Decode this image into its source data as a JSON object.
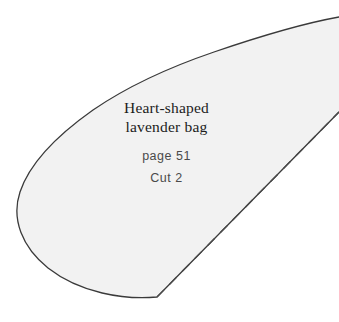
{
  "pattern": {
    "title_line_1": "Heart-shaped",
    "title_line_2": "lavender bag",
    "page_reference": "page 51",
    "cut_instruction": "Cut 2",
    "colors": {
      "background": "#ffffff",
      "shape_fill": "#f2f2f2",
      "outline_stroke": "#3a3a3a",
      "fold_line_stroke": "#4a4a4a",
      "title_text": "#1c1c1c",
      "meta_text": "#4a4a4a"
    },
    "geometry": {
      "cut_outline_path": "M 339,17 C 300,24 255,38 214,52 C 170,67 128,86 93,110 C 59,134 30,162 20,192 C 11,219 22,247 48,268 C 80,293 124,300 157,297 L 339,112",
      "fold_line": {
        "x1": 157,
        "y1": 297,
        "x2": 339,
        "y2": 112,
        "dash": "10 8",
        "width": 1.4
      },
      "outline_width": 1.3,
      "canvas_width": 339,
      "canvas_height": 322
    },
    "icon_names": {
      "cut_outline": "cut-line-outline",
      "fold_line": "fold-line-dashed"
    }
  }
}
